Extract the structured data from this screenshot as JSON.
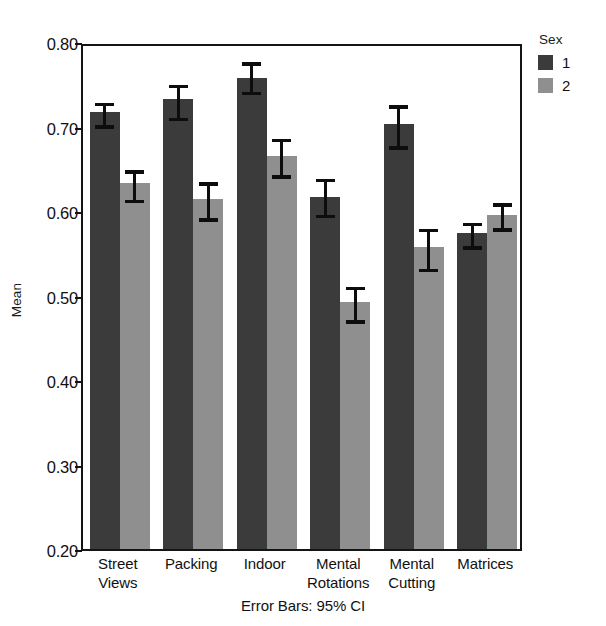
{
  "chart_data": {
    "type": "bar",
    "title": "",
    "xlabel": "",
    "ylabel": "Mean",
    "ylim": [
      0.2,
      0.8
    ],
    "yticks": [
      "0.20",
      "0.30",
      "0.40",
      "0.50",
      "0.60",
      "0.70",
      "0.80"
    ],
    "ytick_values": [
      0.2,
      0.3,
      0.4,
      0.5,
      0.6,
      0.7,
      0.8
    ],
    "grid": false,
    "legend_position": "right",
    "legend_title": "Sex",
    "categories": [
      "Street Views",
      "Packing",
      "Indoor",
      "Mental Rotations",
      "Mental Cutting",
      "Matrices"
    ],
    "category_lines": [
      [
        "Street",
        "Views"
      ],
      [
        "Packing"
      ],
      [
        "Indoor"
      ],
      [
        "Mental",
        "Rotations"
      ],
      [
        "Mental",
        "Cutting"
      ],
      [
        "Matrices"
      ]
    ],
    "annotation": "Error Bars: 95% CI",
    "series": [
      {
        "name": "1",
        "color": "#3b3b3b",
        "values": [
          0.717,
          0.732,
          0.758,
          0.617,
          0.703,
          0.574
        ],
        "ci_low": [
          0.702,
          0.711,
          0.742,
          0.596,
          0.677,
          0.559
        ],
        "ci_high": [
          0.733,
          0.754,
          0.781,
          0.643,
          0.73,
          0.591
        ]
      },
      {
        "name": "2",
        "color": "#8f8f8f",
        "values": [
          0.633,
          0.614,
          0.665,
          0.492,
          0.557,
          0.595
        ],
        "ci_low": [
          0.614,
          0.592,
          0.643,
          0.471,
          0.532,
          0.58
        ],
        "ci_high": [
          0.653,
          0.639,
          0.69,
          0.515,
          0.584,
          0.614
        ]
      }
    ]
  },
  "legend": {
    "title": "Sex",
    "items": [
      {
        "label": "1",
        "color": "#3b3b3b"
      },
      {
        "label": "2",
        "color": "#8f8f8f"
      }
    ]
  },
  "axis": {
    "y_title": "Mean"
  },
  "footnote": {
    "text": "Error Bars: 95% CI"
  }
}
